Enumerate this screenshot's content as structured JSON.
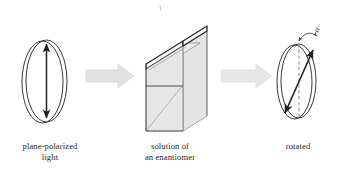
{
  "figure": {
    "background": "#ffffff",
    "line_color": "#231f20",
    "arrow_fill": "#e2e2e2",
    "arrow_stroke": "#d2d2d2",
    "cell_face_fill": "#e8e8e8",
    "cell_side_fill": "#dcdcdc",
    "cell_top_fill": "#f2f2f2",
    "dash_color": "#9a9a9a"
  },
  "stages": [
    {
      "id": "plane-polarized-light",
      "caption_line_1": "plane-polarized",
      "caption_line_2": "light",
      "icon": "vertical-polarization-ellipse",
      "polarization_angle_deg": 0
    },
    {
      "id": "solution-of-an-enantiomer",
      "caption_line_1": "solution of",
      "caption_line_2": "an enantiomer",
      "icon": "sample-cell-3d-box"
    },
    {
      "id": "rotated",
      "caption_line_1": "rotated",
      "caption_line_2": "",
      "icon": "rotated-polarization-ellipse",
      "polarization_angle_deg": 32,
      "angle_symbol": "α"
    }
  ],
  "connectors": [
    {
      "id": "arrow-1",
      "label": "block-arrow-right"
    },
    {
      "id": "arrow-2",
      "label": "block-arrow-right"
    }
  ]
}
